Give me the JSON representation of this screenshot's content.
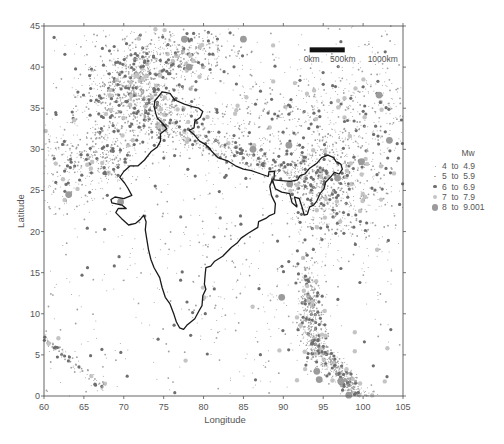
{
  "figure": {
    "caption_visible_fragment": ""
  },
  "chart_data": {
    "type": "scatter",
    "title": "",
    "xlabel": "Longitude",
    "ylabel": "Latitude",
    "xlim": [
      60,
      105
    ],
    "ylim": [
      0,
      45
    ],
    "xticks": [
      60,
      65,
      70,
      75,
      80,
      85,
      90,
      95,
      100,
      105
    ],
    "yticks": [
      0,
      5,
      10,
      15,
      20,
      25,
      30,
      35,
      40,
      45
    ],
    "grid": false,
    "legend_position": "right",
    "legend": {
      "title": "Mw",
      "entries": [
        {
          "label": "4  to  4.9",
          "min": 4,
          "max": 4.9,
          "radius": 0.5,
          "color": "#9a9a9a"
        },
        {
          "label": "5  to  5.9",
          "min": 5,
          "max": 5.9,
          "radius": 0.9,
          "color": "#a0a0a0"
        },
        {
          "label": "6  to  6.9",
          "min": 6,
          "max": 6.9,
          "radius": 1.6,
          "color": "#6e6e6e"
        },
        {
          "label": "7  to  7.9",
          "min": 7,
          "max": 7.9,
          "radius": 2.2,
          "color": "#c4c4c4"
        },
        {
          "label": "8  to  9.001",
          "min": 8,
          "max": 9.001,
          "radius": 3.4,
          "color": "#9b9b9b"
        }
      ]
    },
    "scalebar": {
      "labels": [
        "0km",
        "500km",
        "1000km"
      ],
      "lon_start": 93.3,
      "lon_end": 97.7,
      "lat": 42.1
    },
    "outline_india_lonlat": [
      [
        74.8,
        37.0
      ],
      [
        75.8,
        36.8
      ],
      [
        76.4,
        36.0
      ],
      [
        77.6,
        35.5
      ],
      [
        78.6,
        35.2
      ],
      [
        79.4,
        35.0
      ],
      [
        79.9,
        34.6
      ],
      [
        79.6,
        33.9
      ],
      [
        78.9,
        33.4
      ],
      [
        78.8,
        32.6
      ],
      [
        78.2,
        32.3
      ],
      [
        78.8,
        31.8
      ],
      [
        79.5,
        31.0
      ],
      [
        80.2,
        30.6
      ],
      [
        80.6,
        30.3
      ],
      [
        81.0,
        29.8
      ],
      [
        81.8,
        29.0
      ],
      [
        83.0,
        28.6
      ],
      [
        84.0,
        28.0
      ],
      [
        85.0,
        27.6
      ],
      [
        86.0,
        27.4
      ],
      [
        87.2,
        27.0
      ],
      [
        88.1,
        26.7
      ],
      [
        88.2,
        27.3
      ],
      [
        88.9,
        27.3
      ],
      [
        88.8,
        26.3
      ],
      [
        89.8,
        26.2
      ],
      [
        90.9,
        26.1
      ],
      [
        91.8,
        26.3
      ],
      [
        92.1,
        26.8
      ],
      [
        92.7,
        27.0
      ],
      [
        93.3,
        27.7
      ],
      [
        94.2,
        28.3
      ],
      [
        94.8,
        29.0
      ],
      [
        95.6,
        29.3
      ],
      [
        96.3,
        29.0
      ],
      [
        96.6,
        28.5
      ],
      [
        97.2,
        28.2
      ],
      [
        97.4,
        27.6
      ],
      [
        97.0,
        27.0
      ],
      [
        96.4,
        27.2
      ],
      [
        95.9,
        26.6
      ],
      [
        95.3,
        26.0
      ],
      [
        95.1,
        25.2
      ],
      [
        94.6,
        24.6
      ],
      [
        94.2,
        23.7
      ],
      [
        93.8,
        23.2
      ],
      [
        93.3,
        23.0
      ],
      [
        93.0,
        22.1
      ],
      [
        92.6,
        22.0
      ],
      [
        92.4,
        22.8
      ],
      [
        92.0,
        24.0
      ],
      [
        91.4,
        24.2
      ],
      [
        91.7,
        23.0
      ],
      [
        91.1,
        23.5
      ],
      [
        90.8,
        24.6
      ],
      [
        89.8,
        24.8
      ],
      [
        89.0,
        25.2
      ],
      [
        88.6,
        26.3
      ],
      [
        88.3,
        25.5
      ],
      [
        88.5,
        24.4
      ],
      [
        89.0,
        23.4
      ],
      [
        88.9,
        22.2
      ],
      [
        88.2,
        21.9
      ],
      [
        87.8,
        21.6
      ],
      [
        86.9,
        21.2
      ],
      [
        86.8,
        20.5
      ],
      [
        85.6,
        19.8
      ],
      [
        84.7,
        19.2
      ],
      [
        84.2,
        18.6
      ],
      [
        83.5,
        18.1
      ],
      [
        82.4,
        17.0
      ],
      [
        81.4,
        16.4
      ],
      [
        80.9,
        15.8
      ],
      [
        80.3,
        15.6
      ],
      [
        80.2,
        14.8
      ],
      [
        80.1,
        13.6
      ],
      [
        80.3,
        13.0
      ],
      [
        79.9,
        12.2
      ],
      [
        79.8,
        11.0
      ],
      [
        79.4,
        10.3
      ],
      [
        78.9,
        9.4
      ],
      [
        78.4,
        9.0
      ],
      [
        77.9,
        8.6
      ],
      [
        77.5,
        8.1
      ],
      [
        77.0,
        8.3
      ],
      [
        76.6,
        9.0
      ],
      [
        76.3,
        9.9
      ],
      [
        75.8,
        11.2
      ],
      [
        75.2,
        12.0
      ],
      [
        74.8,
        13.2
      ],
      [
        74.5,
        14.4
      ],
      [
        73.8,
        15.6
      ],
      [
        73.4,
        16.6
      ],
      [
        73.1,
        17.8
      ],
      [
        72.9,
        19.0
      ],
      [
        72.7,
        20.2
      ],
      [
        72.8,
        21.2
      ],
      [
        72.5,
        22.0
      ],
      [
        72.1,
        21.5
      ],
      [
        71.5,
        21.0
      ],
      [
        70.6,
        20.8
      ],
      [
        69.7,
        21.6
      ],
      [
        69.0,
        22.3
      ],
      [
        69.3,
        22.8
      ],
      [
        70.3,
        22.8
      ],
      [
        69.8,
        23.2
      ],
      [
        68.5,
        23.5
      ],
      [
        68.4,
        23.9
      ],
      [
        68.9,
        24.2
      ],
      [
        70.0,
        24.0
      ],
      [
        71.0,
        24.4
      ],
      [
        70.5,
        25.3
      ],
      [
        70.1,
        25.9
      ],
      [
        69.5,
        26.6
      ],
      [
        70.0,
        27.3
      ],
      [
        70.8,
        28.0
      ],
      [
        71.8,
        28.0
      ],
      [
        72.6,
        28.7
      ],
      [
        73.4,
        29.7
      ],
      [
        74.2,
        30.3
      ],
      [
        74.6,
        31.0
      ],
      [
        74.6,
        31.9
      ],
      [
        75.4,
        32.5
      ],
      [
        74.8,
        33.2
      ],
      [
        74.2,
        33.8
      ],
      [
        74.0,
        34.4
      ],
      [
        73.8,
        35.2
      ],
      [
        73.9,
        35.9
      ],
      [
        74.8,
        37.0
      ]
    ],
    "clusters": [
      {
        "name": "hindu-kush-pamir",
        "lon": 71.0,
        "lat": 37.0,
        "sx": 3.0,
        "sy": 2.2,
        "n": 700
      },
      {
        "name": "tien-shan",
        "lon": 76.0,
        "lat": 41.5,
        "sx": 4.5,
        "sy": 1.5,
        "n": 420
      },
      {
        "name": "baluchistan",
        "lon": 67.8,
        "lat": 29.5,
        "sx": 2.0,
        "sy": 2.2,
        "n": 280
      },
      {
        "name": "makran-iran",
        "lon": 62.5,
        "lat": 28.5,
        "sx": 2.0,
        "sy": 3.5,
        "n": 180
      },
      {
        "name": "himalaya-front",
        "lon": 82.0,
        "lat": 29.6,
        "sx": 6.0,
        "sy": 1.0,
        "n": 360
      },
      {
        "name": "tibet",
        "lon": 88.0,
        "lat": 33.5,
        "sx": 8.0,
        "sy": 3.5,
        "n": 450
      },
      {
        "name": "northeast-india",
        "lon": 94.5,
        "lat": 25.5,
        "sx": 2.0,
        "sy": 3.0,
        "n": 450
      },
      {
        "name": "myanmar-yunnan",
        "lon": 99.5,
        "lat": 25.0,
        "sx": 3.5,
        "sy": 5.0,
        "n": 320
      },
      {
        "name": "andaman-arc",
        "lon": 93.5,
        "lat": 10.0,
        "sx": 0.8,
        "sy": 3.2,
        "n": 380
      },
      {
        "name": "sumatra-arc",
        "lon": 97.0,
        "lat": 3.0,
        "sx": 2.2,
        "sy": 1.6,
        "n": 420
      },
      {
        "name": "carlsberg-ridge",
        "lon": 63.5,
        "lat": 4.0,
        "sx": 2.5,
        "sy": 1.5,
        "n": 90
      },
      {
        "name": "northwest-kashmir",
        "lon": 74.5,
        "lat": 33.5,
        "sx": 2.0,
        "sy": 1.5,
        "n": 200
      },
      {
        "name": "qilian-east",
        "lon": 100.0,
        "lat": 35.0,
        "sx": 5.0,
        "sy": 4.5,
        "n": 260
      },
      {
        "name": "peninsula-scatter",
        "lon": 79.0,
        "lat": 18.0,
        "sx": 4.5,
        "sy": 6.0,
        "n": 90
      },
      {
        "name": "bay-of-bengal",
        "lon": 88.0,
        "lat": 12.0,
        "sx": 4.0,
        "sy": 5.0,
        "n": 60
      },
      {
        "name": "background",
        "lon": 82.5,
        "lat": 22.5,
        "sx": 30.0,
        "sy": 30.0,
        "n": 500
      }
    ],
    "notable_large_events_lonlat": [
      [
        77.6,
        43.4
      ],
      [
        85.0,
        43.4
      ],
      [
        78.2,
        40.0
      ],
      [
        102.0,
        36.6
      ],
      [
        103.3,
        31.1
      ],
      [
        63.1,
        24.5
      ],
      [
        69.6,
        23.6
      ],
      [
        86.2,
        30.0
      ],
      [
        90.7,
        30.5
      ],
      [
        96.8,
        26.5
      ],
      [
        90.8,
        25.8
      ],
      [
        94.2,
        3.0
      ],
      [
        94.5,
        2.0
      ],
      [
        97.2,
        1.8
      ],
      [
        98.2,
        0.1
      ],
      [
        89.8,
        12.0
      ],
      [
        99.8,
        28.5
      ]
    ]
  }
}
